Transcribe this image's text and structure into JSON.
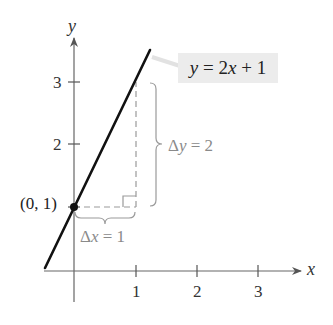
{
  "diagram": {
    "equation_label": "y = 2x + 1",
    "axes": {
      "x_label": "x",
      "y_label": "y",
      "x_ticks": [
        "1",
        "2",
        "3"
      ],
      "y_ticks": [
        "1",
        "2",
        "3"
      ],
      "y_tick_labels_visible": [
        "2",
        "3"
      ]
    },
    "point": {
      "label": "(0, 1)",
      "x": 0,
      "y": 1
    },
    "run": {
      "symbol": "Δ",
      "var": "x",
      "rest": " = 1",
      "full": "Δx = 1"
    },
    "rise": {
      "symbol": "Δ",
      "var": "y",
      "rest": " = 2",
      "full": "Δy = 2"
    },
    "colors": {
      "line": "#111111",
      "axes": "#555555",
      "annotation": "#9a9a9a",
      "label_box": "#ececec"
    }
  },
  "chart_data": {
    "type": "line",
    "title": "y = 2x + 1",
    "xlabel": "x",
    "ylabel": "y",
    "x_ticks": [
      1,
      2,
      3
    ],
    "y_ticks": [
      2,
      3
    ],
    "xlim": [
      -0.5,
      3.7
    ],
    "ylim": [
      -0.05,
      3.5
    ],
    "series": [
      {
        "name": "y = 2x + 1",
        "x": [
          -0.47,
          1.24
        ],
        "y": [
          0.05,
          3.48
        ]
      }
    ],
    "annotations": [
      {
        "type": "point",
        "x": 0,
        "y": 1,
        "text": "(0, 1)"
      },
      {
        "type": "brace-horizontal",
        "from": [
          0,
          1
        ],
        "to": [
          1,
          1
        ],
        "text": "Δx = 1"
      },
      {
        "type": "brace-vertical",
        "from": [
          1,
          1
        ],
        "to": [
          1,
          3
        ],
        "text": "Δy = 2"
      }
    ],
    "grid": false
  }
}
